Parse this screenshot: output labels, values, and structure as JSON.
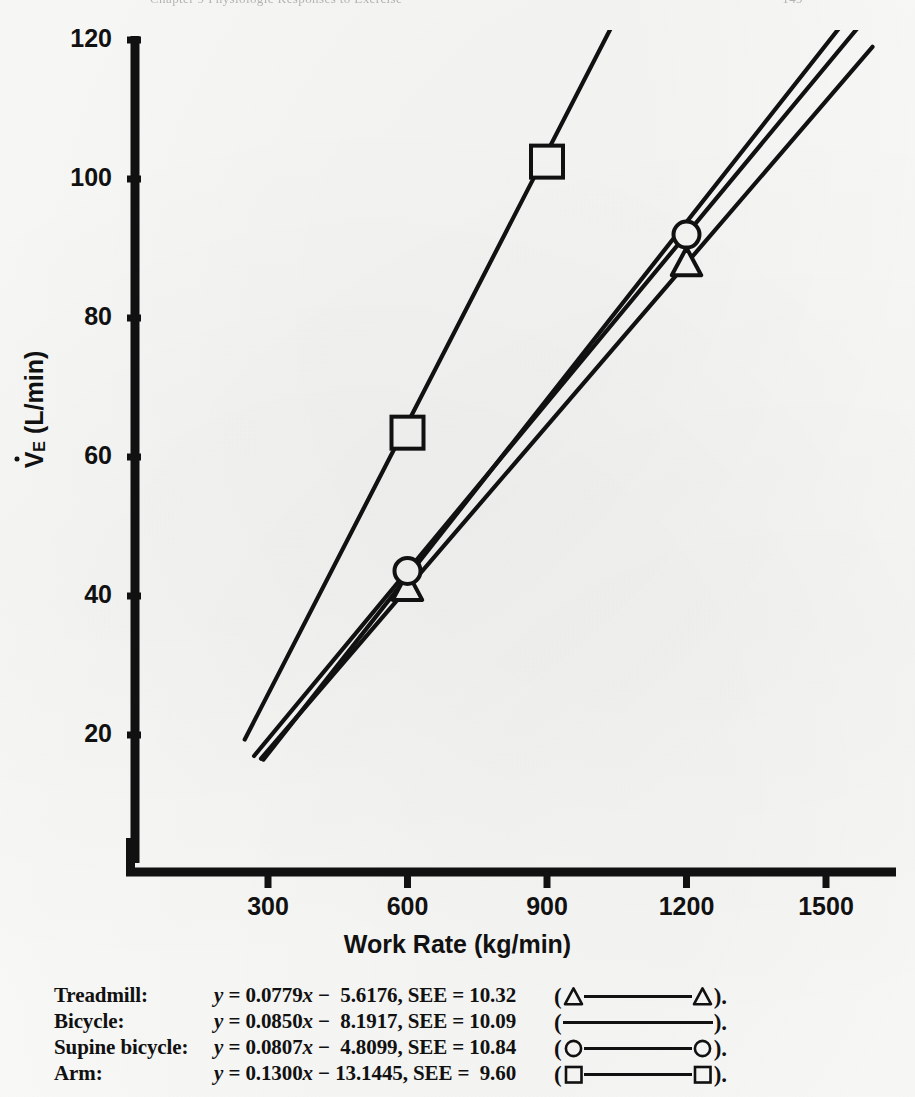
{
  "running_head": {
    "left": "Chapter 9  Physiologic Responses to Exercise",
    "right": "149"
  },
  "chart_data": {
    "type": "line",
    "title": "",
    "xlabel": "Work Rate (kg/min)",
    "ylabel": "V̇E (L/min)",
    "ylabel_parts": {
      "symbol": "V",
      "subscript": "E",
      "units": "(L/min)"
    },
    "xlim": [
      0,
      1700
    ],
    "ylim": [
      0,
      126
    ],
    "xticks": [
      300,
      600,
      900,
      1200,
      1500
    ],
    "yticks": [
      20,
      40,
      60,
      80,
      100,
      120
    ],
    "grid": false,
    "legend_position": "below-axes",
    "series": [
      {
        "name": "Treadmill",
        "label": "Treadmill:",
        "equation": "y = 0.0779x −  5.6176, SEE = 10.32",
        "slope": 0.0779,
        "intercept": -5.6176,
        "see": 10.32,
        "marker": "triangle",
        "x_range": [
          285,
          1600
        ],
        "points": [
          {
            "x": 600,
            "y": 41.1
          },
          {
            "x": 1200,
            "y": 87.8
          }
        ]
      },
      {
        "name": "Bicycle",
        "label": "Bicycle:",
        "equation": "y = 0.0850x −  8.1917, SEE = 10.09",
        "slope": 0.085,
        "intercept": -8.1917,
        "see": 10.09,
        "marker": "none",
        "x_range": [
          290,
          1600
        ],
        "points": []
      },
      {
        "name": "Supine bicycle",
        "label": "Supine bicycle:",
        "equation": "y = 0.0807x −  4.8099, SEE = 10.84",
        "slope": 0.0807,
        "intercept": -4.8099,
        "see": 10.84,
        "marker": "circle",
        "x_range": [
          270,
          1600
        ],
        "points": [
          {
            "x": 600,
            "y": 43.6
          },
          {
            "x": 1200,
            "y": 92.0
          }
        ]
      },
      {
        "name": "Arm",
        "label": "Arm:",
        "equation": "y = 0.1300x − 13.1445, SEE =  9.60",
        "slope": 0.13,
        "intercept": -13.1445,
        "see": 9.6,
        "marker": "square",
        "x_range": [
          250,
          1053
        ],
        "points": [
          {
            "x": 600,
            "y": 63.5
          },
          {
            "x": 900,
            "y": 102.5
          }
        ]
      }
    ]
  },
  "colors": {
    "ink": "#111111",
    "page": "#fbfbfa"
  }
}
